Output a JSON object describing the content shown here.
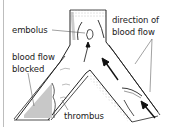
{
  "figure": {
    "type": "diagram",
    "labels": {
      "embolus": "embolus",
      "direction_line1": "direction of",
      "direction_line2": "blood flow",
      "blocked_line1": "blood flow",
      "blocked_line2": "blocked",
      "thrombus": "thrombus"
    },
    "colors": {
      "outline": "#222222",
      "blocked_fill": "#c8c8c8",
      "stipple": "#9a9a9a",
      "edge_line": "#bdbdbd"
    }
  }
}
